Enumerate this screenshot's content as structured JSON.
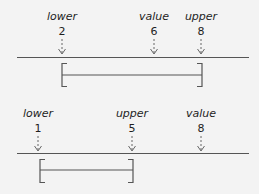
{
  "diagrams": [
    {
      "id": "value-inside-range",
      "markers": [
        {
          "role": "lower",
          "label": "lower",
          "value": "2",
          "x": 62
        },
        {
          "role": "value",
          "label": "value",
          "value": "6",
          "x": 154
        },
        {
          "role": "upper",
          "label": "upper",
          "value": "8",
          "x": 201
        }
      ],
      "axis": {
        "x1": 17,
        "x2": 249,
        "y": 57
      },
      "bracket": {
        "x1": 62,
        "x2": 202,
        "top": 63,
        "bottom": 87,
        "mid": 75
      }
    },
    {
      "id": "value-outside-range",
      "markers": [
        {
          "role": "lower",
          "label": "lower",
          "value": "1",
          "x": 38
        },
        {
          "role": "upper",
          "label": "upper",
          "value": "5",
          "x": 132
        },
        {
          "role": "value",
          "label": "value",
          "value": "8",
          "x": 201
        }
      ],
      "axis": {
        "x1": 17,
        "x2": 249,
        "y": 56
      },
      "bracket": {
        "x1": 40,
        "x2": 133,
        "top": 62,
        "bottom": 86,
        "mid": 73
      }
    }
  ],
  "colors": {
    "background": "#f3f3f3",
    "text": "#1e1e1e",
    "line": "#555555",
    "arrow": "#666666"
  }
}
